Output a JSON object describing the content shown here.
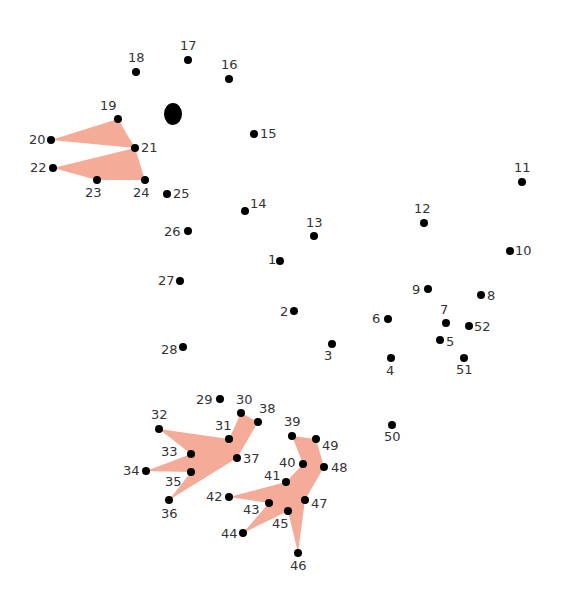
{
  "puzzle": {
    "type": "connect-the-dots",
    "fill_color": "#f4ac98",
    "dot_color": "#000000",
    "eye": {
      "x": 173,
      "y": 114,
      "rx": 9,
      "ry": 11
    },
    "dots": [
      {
        "n": "1",
        "x": 280,
        "y": 261,
        "lx": -12,
        "ly": -8,
        "align": "left"
      },
      {
        "n": "2",
        "x": 294,
        "y": 311,
        "lx": -14,
        "ly": -6,
        "align": "left"
      },
      {
        "n": "3",
        "x": 332,
        "y": 344,
        "lx": -8,
        "ly": 5,
        "align": "below"
      },
      {
        "n": "4",
        "x": 391,
        "y": 358,
        "lx": -5,
        "ly": 6,
        "align": "below"
      },
      {
        "n": "5",
        "x": 440,
        "y": 340,
        "lx": 6,
        "ly": -5,
        "align": "right"
      },
      {
        "n": "6",
        "x": 388,
        "y": 319,
        "lx": -16,
        "ly": -7,
        "align": "left"
      },
      {
        "n": "7",
        "x": 446,
        "y": 323,
        "lx": -6,
        "ly": -20,
        "align": "above"
      },
      {
        "n": "8",
        "x": 481,
        "y": 295,
        "lx": 6,
        "ly": -6,
        "align": "right"
      },
      {
        "n": "9",
        "x": 428,
        "y": 289,
        "lx": -16,
        "ly": -6,
        "align": "left"
      },
      {
        "n": "10",
        "x": 510,
        "y": 251,
        "lx": 5,
        "ly": -7,
        "align": "right"
      },
      {
        "n": "11",
        "x": 522,
        "y": 182,
        "lx": -8,
        "ly": -21,
        "align": "above"
      },
      {
        "n": "12",
        "x": 424,
        "y": 223,
        "lx": -10,
        "ly": -21,
        "align": "above"
      },
      {
        "n": "13",
        "x": 314,
        "y": 236,
        "lx": -8,
        "ly": -20,
        "align": "above"
      },
      {
        "n": "14",
        "x": 245,
        "y": 211,
        "lx": 5,
        "ly": -14,
        "align": "right"
      },
      {
        "n": "15",
        "x": 254,
        "y": 134,
        "lx": 6,
        "ly": -7,
        "align": "right"
      },
      {
        "n": "16",
        "x": 229,
        "y": 79,
        "lx": -8,
        "ly": -21,
        "align": "above"
      },
      {
        "n": "17",
        "x": 188,
        "y": 60,
        "lx": -8,
        "ly": -21,
        "align": "above"
      },
      {
        "n": "18",
        "x": 136,
        "y": 72,
        "lx": -8,
        "ly": -21,
        "align": "above"
      },
      {
        "n": "19",
        "x": 118,
        "y": 119,
        "lx": -18,
        "ly": -20,
        "align": "above"
      },
      {
        "n": "20",
        "x": 51,
        "y": 140,
        "lx": -22,
        "ly": -7,
        "align": "left"
      },
      {
        "n": "21",
        "x": 135,
        "y": 148,
        "lx": 6,
        "ly": -7,
        "align": "right"
      },
      {
        "n": "22",
        "x": 53,
        "y": 168,
        "lx": -23,
        "ly": -7,
        "align": "left"
      },
      {
        "n": "23",
        "x": 97,
        "y": 180,
        "lx": -12,
        "ly": 6,
        "align": "below"
      },
      {
        "n": "24",
        "x": 145,
        "y": 180,
        "lx": -12,
        "ly": 6,
        "align": "below"
      },
      {
        "n": "25",
        "x": 167,
        "y": 194,
        "lx": 6,
        "ly": -7,
        "align": "right"
      },
      {
        "n": "26",
        "x": 188,
        "y": 231,
        "lx": -24,
        "ly": -6,
        "align": "left"
      },
      {
        "n": "27",
        "x": 180,
        "y": 281,
        "lx": -22,
        "ly": -7,
        "align": "left"
      },
      {
        "n": "28",
        "x": 183,
        "y": 347,
        "lx": -22,
        "ly": -4,
        "align": "left"
      },
      {
        "n": "29",
        "x": 220,
        "y": 399,
        "lx": -24,
        "ly": -6,
        "align": "left"
      },
      {
        "n": "30",
        "x": 241,
        "y": 413,
        "lx": -5,
        "ly": -20,
        "align": "above"
      },
      {
        "n": "31",
        "x": 229,
        "y": 439,
        "lx": -14,
        "ly": -20,
        "align": "above"
      },
      {
        "n": "32",
        "x": 159,
        "y": 429,
        "lx": -8,
        "ly": -21,
        "align": "above"
      },
      {
        "n": "33",
        "x": 191,
        "y": 454,
        "lx": -30,
        "ly": -9,
        "align": "left"
      },
      {
        "n": "34",
        "x": 146,
        "y": 471,
        "lx": -23,
        "ly": -7,
        "align": "left"
      },
      {
        "n": "35",
        "x": 191,
        "y": 472,
        "lx": -26,
        "ly": 3,
        "align": "left"
      },
      {
        "n": "36",
        "x": 169,
        "y": 500,
        "lx": -8,
        "ly": 7,
        "align": "below"
      },
      {
        "n": "37",
        "x": 237,
        "y": 458,
        "lx": 6,
        "ly": -6,
        "align": "right"
      },
      {
        "n": "38",
        "x": 258,
        "y": 422,
        "lx": 1,
        "ly": -20,
        "align": "above"
      },
      {
        "n": "39",
        "x": 292,
        "y": 436,
        "lx": -8,
        "ly": -21,
        "align": "above"
      },
      {
        "n": "40",
        "x": 303,
        "y": 464,
        "lx": -24,
        "ly": -8,
        "align": "left"
      },
      {
        "n": "41",
        "x": 286,
        "y": 482,
        "lx": -22,
        "ly": -13,
        "align": "left"
      },
      {
        "n": "42",
        "x": 229,
        "y": 497,
        "lx": -23,
        "ly": -7,
        "align": "left"
      },
      {
        "n": "43",
        "x": 269,
        "y": 503,
        "lx": -26,
        "ly": 0,
        "align": "left"
      },
      {
        "n": "44",
        "x": 243,
        "y": 533,
        "lx": -22,
        "ly": -6,
        "align": "left"
      },
      {
        "n": "45",
        "x": 288,
        "y": 511,
        "lx": -16,
        "ly": 6,
        "align": "below"
      },
      {
        "n": "46",
        "x": 298,
        "y": 553,
        "lx": -8,
        "ly": 6,
        "align": "below"
      },
      {
        "n": "47",
        "x": 305,
        "y": 500,
        "lx": 6,
        "ly": -3,
        "align": "right"
      },
      {
        "n": "48",
        "x": 324,
        "y": 467,
        "lx": 7,
        "ly": -6,
        "align": "right"
      },
      {
        "n": "49",
        "x": 316,
        "y": 439,
        "lx": 6,
        "ly": 0,
        "align": "right"
      },
      {
        "n": "50",
        "x": 392,
        "y": 425,
        "lx": -8,
        "ly": 5,
        "align": "below"
      },
      {
        "n": "51",
        "x": 464,
        "y": 358,
        "lx": -8,
        "ly": 5,
        "align": "below"
      },
      {
        "n": "52",
        "x": 469,
        "y": 326,
        "lx": 5,
        "ly": -6,
        "align": "right"
      }
    ],
    "filled_shapes": [
      {
        "name": "upper-beak",
        "points": [
          [
            51,
            140
          ],
          [
            118,
            119
          ],
          [
            135,
            148
          ]
        ]
      },
      {
        "name": "lower-beak",
        "points": [
          [
            53,
            168
          ],
          [
            135,
            148
          ],
          [
            145,
            180
          ],
          [
            97,
            180
          ]
        ]
      },
      {
        "name": "left-foot",
        "points": [
          [
            159,
            429
          ],
          [
            229,
            439
          ],
          [
            241,
            413
          ],
          [
            258,
            422
          ],
          [
            237,
            458
          ],
          [
            169,
            500
          ],
          [
            191,
            472
          ],
          [
            146,
            471
          ],
          [
            191,
            454
          ]
        ]
      },
      {
        "name": "right-foot",
        "points": [
          [
            292,
            436
          ],
          [
            316,
            439
          ],
          [
            324,
            467
          ],
          [
            305,
            500
          ],
          [
            298,
            553
          ],
          [
            288,
            511
          ],
          [
            243,
            533
          ],
          [
            269,
            503
          ],
          [
            229,
            497
          ],
          [
            286,
            482
          ],
          [
            303,
            464
          ]
        ]
      }
    ]
  }
}
